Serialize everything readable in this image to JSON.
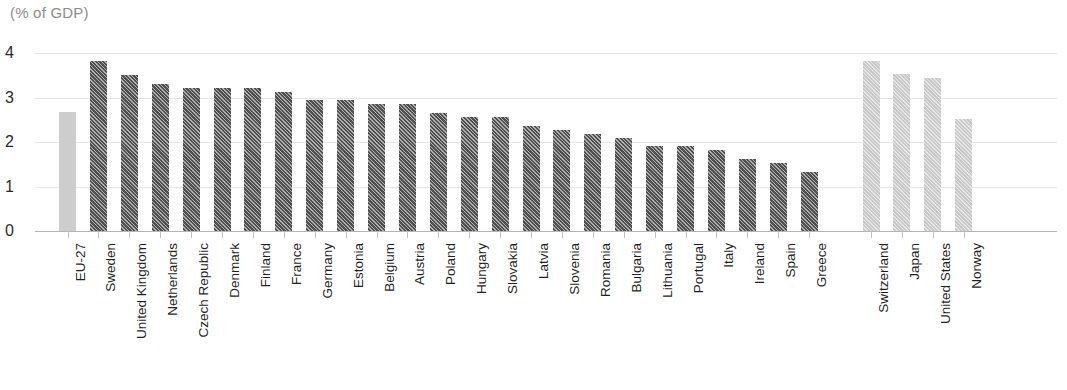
{
  "chart_data": {
    "type": "bar",
    "title": "(% of GDP)",
    "subtitle": "",
    "xlabel": "",
    "ylabel": "",
    "ylim": [
      0,
      4
    ],
    "yticks": [
      "0",
      "1",
      "2",
      "3",
      "4"
    ],
    "grid": "horizontal",
    "legend": "none",
    "categories": [
      "EU-27",
      "Sweden",
      "United Kingdom",
      "Netherlands",
      "Czech Republic",
      "Denmark",
      "Finland",
      "France",
      "Germany",
      "Estonia",
      "Belgium",
      "Austria",
      "Poland",
      "Hungary",
      "Slovakia",
      "Latvia",
      "Slovenia",
      "Romania",
      "Bulgaria",
      "Lithuania",
      "Portugal",
      "Italy",
      "Ireland",
      "Spain",
      "Greece",
      "Switzerland",
      "Japan",
      "United States",
      "Norway"
    ],
    "values": [
      2.67,
      3.82,
      3.51,
      3.31,
      3.22,
      3.22,
      3.22,
      3.13,
      2.94,
      2.94,
      2.85,
      2.86,
      2.66,
      2.56,
      2.56,
      2.37,
      2.27,
      2.18,
      2.08,
      1.91,
      1.91,
      1.81,
      1.62,
      1.53,
      1.33,
      3.82,
      3.53,
      3.43,
      2.52
    ],
    "bar_styles": [
      "plain-light",
      "hatch-dark",
      "hatch-dark",
      "hatch-dark",
      "hatch-dark",
      "hatch-dark",
      "hatch-dark",
      "hatch-dark",
      "hatch-dark",
      "hatch-dark",
      "hatch-dark",
      "hatch-dark",
      "hatch-dark",
      "hatch-dark",
      "hatch-dark",
      "hatch-dark",
      "hatch-dark",
      "hatch-dark",
      "hatch-dark",
      "hatch-dark",
      "hatch-dark",
      "hatch-dark",
      "hatch-dark",
      "hatch-dark",
      "hatch-dark",
      "hatch-light",
      "hatch-light",
      "hatch-light",
      "hatch-light"
    ],
    "group_gap_after_index": 24,
    "colors": {
      "bar_dark": "#4f4f4f",
      "bar_light": "#c9c9c9",
      "bar_aggregate": "#cdcdcd",
      "gridline": "#e6e6e6",
      "axis": "#b5b5b5",
      "title_text": "#8d8d8d",
      "label_text": "#1f1f1f"
    }
  }
}
